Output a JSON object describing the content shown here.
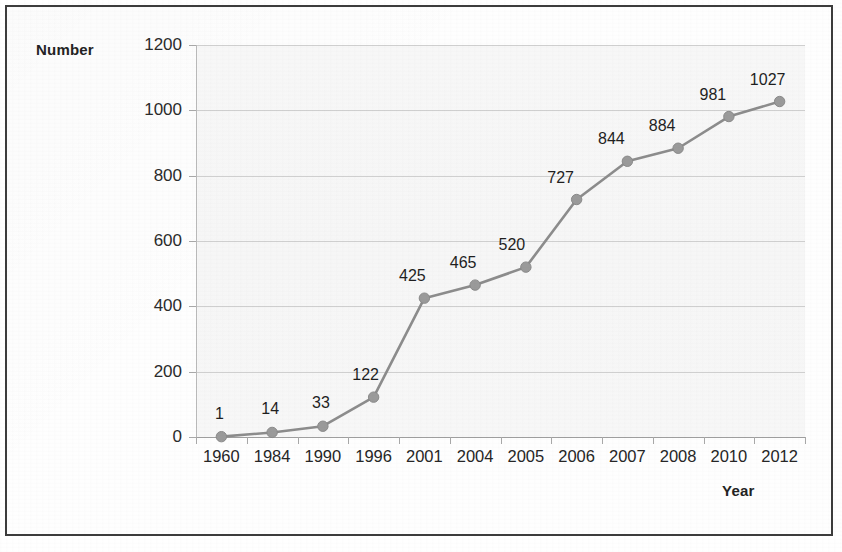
{
  "figure": {
    "y_axis_title": "Number",
    "x_axis_title": "Year"
  },
  "chart_data": {
    "type": "line",
    "title": "",
    "xlabel": "Year",
    "ylabel": "Number",
    "categories": [
      "1960",
      "1984",
      "1990",
      "1996",
      "2001",
      "2004",
      "2005",
      "2006",
      "2007",
      "2008",
      "2010",
      "2012"
    ],
    "values": [
      1,
      14,
      33,
      122,
      425,
      465,
      520,
      727,
      844,
      884,
      981,
      1027
    ],
    "point_labels": [
      "1",
      "14",
      "33",
      "122",
      "425",
      "465",
      "520",
      "727",
      "844",
      "884",
      "981",
      "1027"
    ],
    "ylim": [
      0,
      1200
    ],
    "yticks": [
      0,
      200,
      400,
      600,
      800,
      1000,
      1200
    ],
    "ytick_labels": [
      "0",
      "200",
      "400",
      "600",
      "800",
      "1000",
      "1200"
    ],
    "grid": true,
    "grid_axis": "y",
    "legend": false,
    "legend_position": "none",
    "series": [
      {
        "name": "Number",
        "values": [
          1,
          14,
          33,
          122,
          425,
          465,
          520,
          727,
          844,
          884,
          981,
          1027
        ],
        "line_color": "#8c8c8c",
        "marker_color": "#9a9a9a",
        "marker": "circle"
      }
    ],
    "colors": {
      "line": "#8c8c8c",
      "marker": "#9a9a9a",
      "grid": "#cfcfcf",
      "plot_background": "#f6f6f6",
      "axis": "#9e9e9e",
      "text": "#262626",
      "frame_border": "#3c3c3c"
    }
  }
}
